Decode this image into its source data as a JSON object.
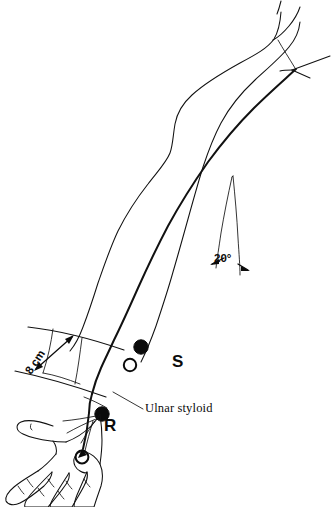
{
  "labels": {
    "stim_proximal": "S",
    "stim_distal": "R",
    "angle": "20°",
    "distance": "8 cm",
    "landmark": "Ulnar styloid",
    "caption": ""
  },
  "annotations": {
    "angle_value": 20,
    "angle_unit": "degrees",
    "distance_value": 8,
    "distance_unit": "cm",
    "landmark_name": "Ulnar styloid"
  },
  "electrodes": [
    {
      "id": "s-cathode",
      "site": "S",
      "role": "cathode",
      "style": "filled",
      "x": 141,
      "y": 347
    },
    {
      "id": "s-anode",
      "site": "S",
      "role": "anode",
      "style": "open",
      "x": 130,
      "y": 365
    },
    {
      "id": "r-cathode",
      "site": "R",
      "role": "cathode",
      "style": "filled",
      "x": 102,
      "y": 414
    },
    {
      "id": "r-ring",
      "site": "R",
      "role": "ring recording electrode",
      "style": "open",
      "x": 82,
      "y": 457
    }
  ],
  "colors": {
    "ink": "#111111",
    "background": "#ffffff",
    "electrode_fill": "#0b0b0b",
    "electrode_open_fill": "#ffffff"
  }
}
